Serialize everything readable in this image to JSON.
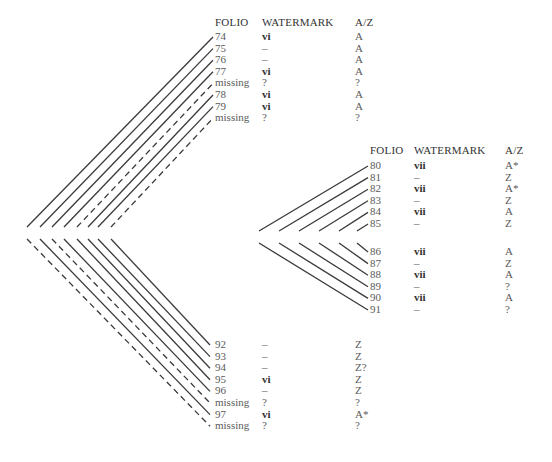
{
  "gatherings": [
    {
      "id": "gathering-1",
      "headers": {
        "folio": "FOLIO",
        "watermark": "WATERMARK",
        "az": "A/Z"
      },
      "header_pos": {
        "x_folio": 215,
        "x_wm": 262,
        "x_az": 355,
        "y": 17
      },
      "upper_rows": [
        {
          "folio": "74",
          "watermark": "vi",
          "az": "A",
          "dashed": false
        },
        {
          "folio": "75",
          "watermark": "–",
          "az": "A",
          "dashed": false
        },
        {
          "folio": "76",
          "watermark": "–",
          "az": "A",
          "dashed": false
        },
        {
          "folio": "77",
          "watermark": "vi",
          "az": "A",
          "dashed": false
        },
        {
          "folio": "missing",
          "watermark": "?",
          "az": "?",
          "dashed": true
        },
        {
          "folio": "78",
          "watermark": "vi",
          "az": "A",
          "dashed": false
        },
        {
          "folio": "79",
          "watermark": "vi",
          "az": "A",
          "dashed": false
        },
        {
          "folio": "missing",
          "watermark": "?",
          "az": "?",
          "dashed": true
        }
      ],
      "lower_rows": [
        {
          "folio": "92",
          "watermark": "–",
          "az": "Z",
          "dashed": false
        },
        {
          "folio": "93",
          "watermark": "–",
          "az": "Z",
          "dashed": false
        },
        {
          "folio": "94",
          "watermark": "–",
          "az": "Z?",
          "dashed": false
        },
        {
          "folio": "95",
          "watermark": "vi",
          "az": "Z",
          "dashed": false
        },
        {
          "folio": "96",
          "watermark": "–",
          "az": "Z",
          "dashed": false
        },
        {
          "folio": "missing",
          "watermark": "?",
          "az": "?",
          "dashed": true
        },
        {
          "folio": "97",
          "watermark": "vi",
          "az": "A*",
          "dashed": false
        },
        {
          "folio": "missing",
          "watermark": "?",
          "az": "?",
          "dashed": true
        }
      ]
    },
    {
      "id": "gathering-2",
      "headers": {
        "folio": "FOLIO",
        "watermark": "WATERMARK",
        "az": "A/Z"
      },
      "header_pos": {
        "x_folio": 370,
        "x_wm": 414,
        "x_az": 505,
        "y": 145
      },
      "upper_rows": [
        {
          "folio": "80",
          "watermark": "vii",
          "az": "A*",
          "dashed": false
        },
        {
          "folio": "81",
          "watermark": "–",
          "az": "Z",
          "dashed": false
        },
        {
          "folio": "82",
          "watermark": "vii",
          "az": "A*",
          "dashed": false
        },
        {
          "folio": "83",
          "watermark": "–",
          "az": "Z",
          "dashed": false
        },
        {
          "folio": "84",
          "watermark": "vii",
          "az": "A",
          "dashed": false
        },
        {
          "folio": "85",
          "watermark": "–",
          "az": "Z",
          "dashed": false
        }
      ],
      "lower_rows": [
        {
          "folio": "86",
          "watermark": "vii",
          "az": "A",
          "dashed": false
        },
        {
          "folio": "87",
          "watermark": "–",
          "az": "Z",
          "dashed": false
        },
        {
          "folio": "88",
          "watermark": "vii",
          "az": "A",
          "dashed": false
        },
        {
          "folio": "89",
          "watermark": "–",
          "az": "?",
          "dashed": false
        },
        {
          "folio": "90",
          "watermark": "vii",
          "az": "A",
          "dashed": false
        },
        {
          "folio": "91",
          "watermark": "–",
          "az": "?",
          "dashed": false
        }
      ]
    }
  ],
  "colors": {
    "line": "#3a3a3a",
    "text": "#5a5a5a",
    "header": "#333333"
  }
}
